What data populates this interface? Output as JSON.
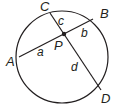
{
  "diagram": {
    "type": "geometry-intersecting-chords",
    "circle": {
      "cx": 62,
      "cy": 57,
      "r": 47
    },
    "points": {
      "A": {
        "label": "A",
        "x": 20,
        "y": 57
      },
      "B": {
        "label": "B",
        "x": 92,
        "y": 19
      },
      "C": {
        "label": "C",
        "x": 50,
        "y": 13
      },
      "D": {
        "label": "D",
        "x": 100,
        "y": 89
      },
      "P": {
        "label": "P",
        "x": 63,
        "y": 34
      }
    },
    "chords": [
      {
        "from": "A",
        "to": "B"
      },
      {
        "from": "C",
        "to": "D"
      }
    ],
    "segments": {
      "a": "a",
      "b": "b",
      "c": "c",
      "d": "d"
    },
    "colors": {
      "stroke": "#231f20",
      "background": "#ffffff"
    }
  }
}
